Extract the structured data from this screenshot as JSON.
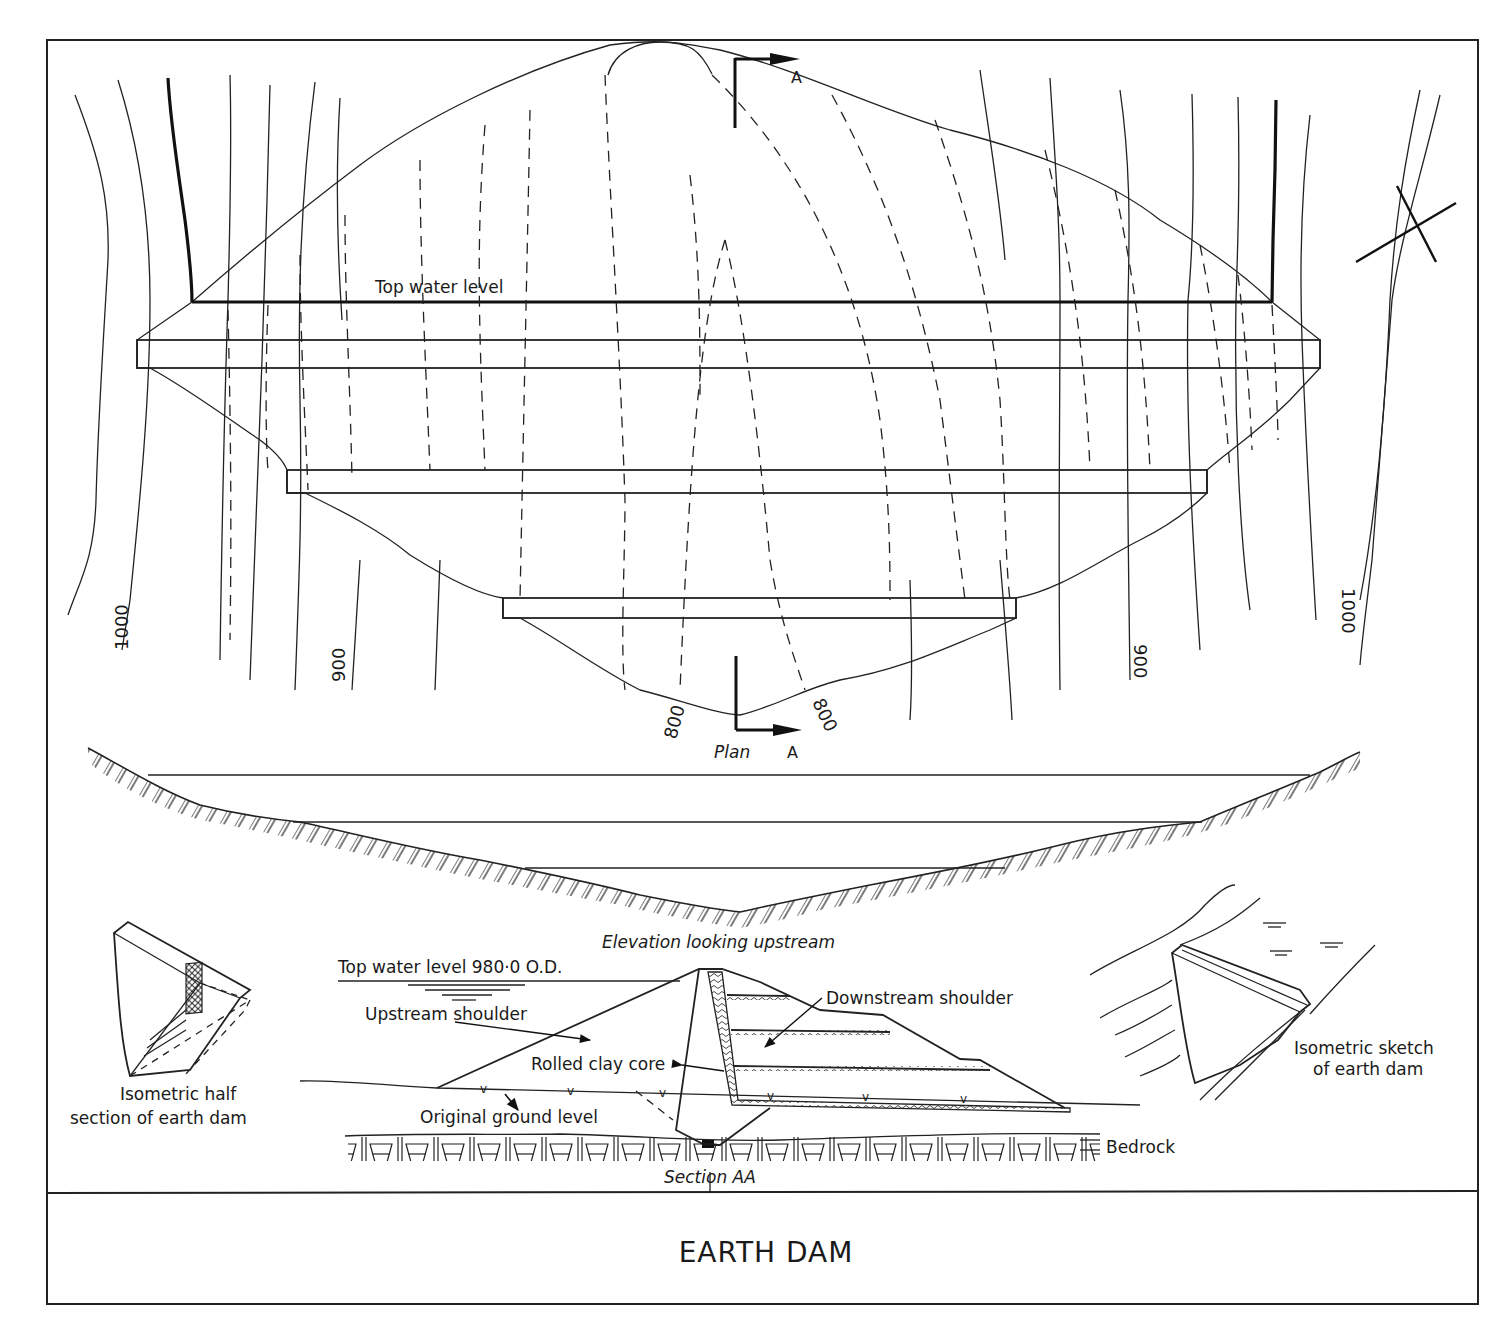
{
  "title_block": {
    "title": "EARTH DAM"
  },
  "plan_view": {
    "caption": "Plan",
    "section_marker_top": "A",
    "section_marker_bottom": "A",
    "top_water_level_label": "Top water level",
    "contour_labels": {
      "left_1000": "1000",
      "left_900": "900",
      "bottom_left_800": "800",
      "bottom_right_800": "800",
      "right_900": "900",
      "right_1000": "1000"
    },
    "north_symbol": "cross-mark"
  },
  "elevation_view": {
    "caption": "Elevation looking upstream"
  },
  "section_aa": {
    "caption": "Section AA",
    "top_water_level": "Top water level 980·0 O.D.",
    "upstream_shoulder": "Upstream shoulder",
    "downstream_shoulder": "Downstream shoulder",
    "rolled_clay_core": "Rolled clay core",
    "original_ground_level": "Original ground level",
    "bedrock": "Bedrock"
  },
  "isometric_half_section": {
    "caption_line1": "Isometric half",
    "caption_line2": "section of earth dam"
  },
  "isometric_sketch": {
    "caption_line1": "Isometric sketch",
    "caption_line2": "of earth dam"
  },
  "colors": {
    "ink": "#1a1a1a",
    "paper": "#ffffff"
  }
}
